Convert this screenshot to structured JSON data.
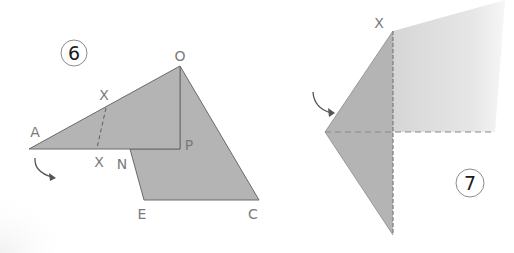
{
  "colors": {
    "paper_dark": "#b4b4b4",
    "paper_light": "#d9d9d9",
    "edge": "#6a6a6a",
    "fold_line": "#8a8a8a",
    "label": "#7a7a7a",
    "arrow": "#555555",
    "circle": "#8c8c8c"
  },
  "steps": [
    {
      "number": "6",
      "labels": {
        "O": "O",
        "A": "A",
        "P": "P",
        "N": "N",
        "E": "E",
        "C": "C",
        "X_top": "X",
        "X_bottom": "X"
      }
    },
    {
      "number": "7",
      "labels": {
        "X": "X"
      }
    }
  ]
}
